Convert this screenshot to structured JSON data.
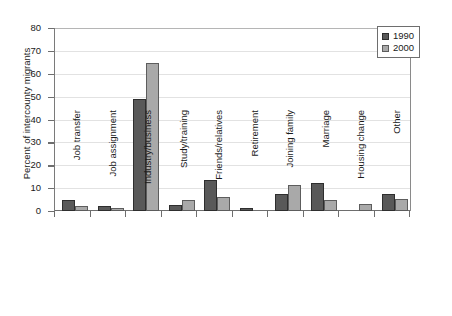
{
  "chart_data": {
    "type": "bar",
    "title": "",
    "subtitle": "",
    "xlabel": "",
    "ylabel": "Percent of intercounty migrants",
    "ylim": [
      0,
      80
    ],
    "ytick_step": 10,
    "yticks": [
      "80",
      "70",
      "60",
      "50",
      "40",
      "30",
      "20",
      "10",
      "0"
    ],
    "grid": "horizontal",
    "legend_position": "top-right",
    "categories": [
      "Job transfer",
      "Job assignment",
      "Industry/business",
      "Study/training",
      "Friends/relatives",
      "Retirement",
      "Joining family",
      "Marriage",
      "Housing change",
      "Other"
    ],
    "series": [
      {
        "name": "1990",
        "color": "#595959",
        "values": [
          4.7,
          2.4,
          49.0,
          2.7,
          13.4,
          1.5,
          7.4,
          12.2,
          0.0,
          7.3
        ]
      },
      {
        "name": "2000",
        "color": "#a9a9a9",
        "values": [
          2.3,
          1.4,
          64.5,
          4.9,
          6.0,
          0.0,
          11.2,
          4.7,
          3.2,
          5.2
        ]
      }
    ]
  },
  "legend": {
    "entries": [
      {
        "label": "1990"
      },
      {
        "label": "2000"
      }
    ]
  },
  "colors": {
    "series_1990": "#595959",
    "series_2000": "#a9a9a9",
    "axis": "#6e6e6e",
    "gridline": "#e2e2e2",
    "background": "#ffffff",
    "text": "#1a1a1a"
  }
}
